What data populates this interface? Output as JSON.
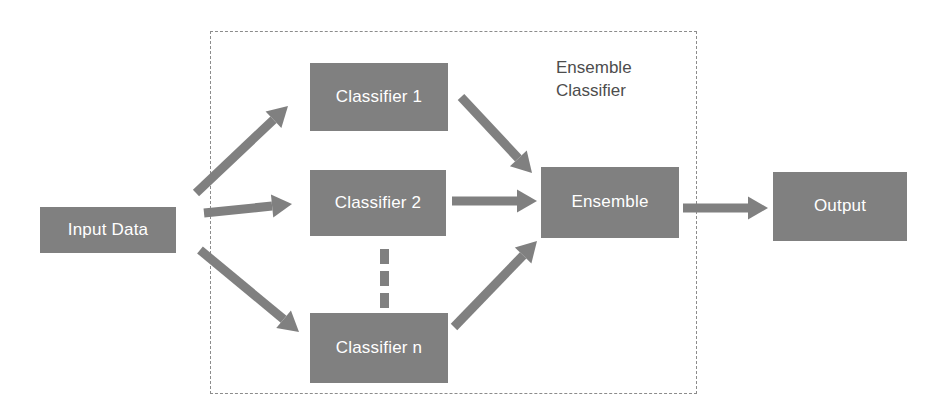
{
  "diagram": {
    "background_color": "#ffffff",
    "box_fill_color": "#808080",
    "box_text_color": "#ffffff",
    "arrow_color": "#808080",
    "dashed_border_color": "#8c8c8c",
    "group_label_color": "#4d4d4d"
  },
  "nodes": {
    "input": {
      "label": "Input Data",
      "x": 40,
      "y": 207,
      "w": 136,
      "h": 46
    },
    "classifier1": {
      "label": "Classifier 1",
      "x": 310,
      "y": 63,
      "w": 138,
      "h": 68
    },
    "classifier2": {
      "label": "Classifier 2",
      "x": 310,
      "y": 170,
      "w": 136,
      "h": 66
    },
    "classifiern": {
      "label": "Classifier n",
      "x": 310,
      "y": 313,
      "w": 138,
      "h": 70
    },
    "ensemble": {
      "label": "Ensemble",
      "x": 541,
      "y": 167,
      "w": 138,
      "h": 71
    },
    "output": {
      "label": "Output",
      "x": 773,
      "y": 172,
      "w": 134,
      "h": 69
    }
  },
  "group": {
    "label": "Ensemble\nClassifier",
    "label_x": 556,
    "label_y": 57,
    "box": {
      "x": 210,
      "y": 31,
      "w": 487,
      "h": 363
    }
  },
  "ellipsis": {
    "name": "vertical-ellipsis",
    "dots": [
      {
        "x": 380,
        "y": 249
      },
      {
        "x": 380,
        "y": 271
      },
      {
        "x": 380,
        "y": 293
      }
    ]
  },
  "edges": [
    {
      "name": "input-to-classifier1",
      "from": "Input Data",
      "to": "Classifier 1",
      "x1": 196,
      "y1": 193,
      "x2": 288,
      "y2": 106
    },
    {
      "name": "input-to-classifier2",
      "from": "Input Data",
      "to": "Classifier 2",
      "x1": 204,
      "y1": 213,
      "x2": 292,
      "y2": 204
    },
    {
      "name": "input-to-classifiern",
      "from": "Input Data",
      "to": "Classifier n",
      "x1": 200,
      "y1": 250,
      "x2": 299,
      "y2": 332
    },
    {
      "name": "classifier1-to-ensemble",
      "from": "Classifier 1",
      "to": "Ensemble",
      "x1": 461,
      "y1": 97,
      "x2": 532,
      "y2": 173
    },
    {
      "name": "classifier2-to-ensemble",
      "from": "Classifier 2",
      "to": "Ensemble",
      "x1": 452,
      "y1": 201,
      "x2": 537,
      "y2": 201
    },
    {
      "name": "classifiern-to-ensemble",
      "from": "Classifier n",
      "to": "Ensemble",
      "x1": 454,
      "y1": 327,
      "x2": 537,
      "y2": 241
    },
    {
      "name": "ensemble-to-output",
      "from": "Ensemble",
      "to": "Output",
      "x1": 683,
      "y1": 208,
      "x2": 768,
      "y2": 208
    }
  ]
}
